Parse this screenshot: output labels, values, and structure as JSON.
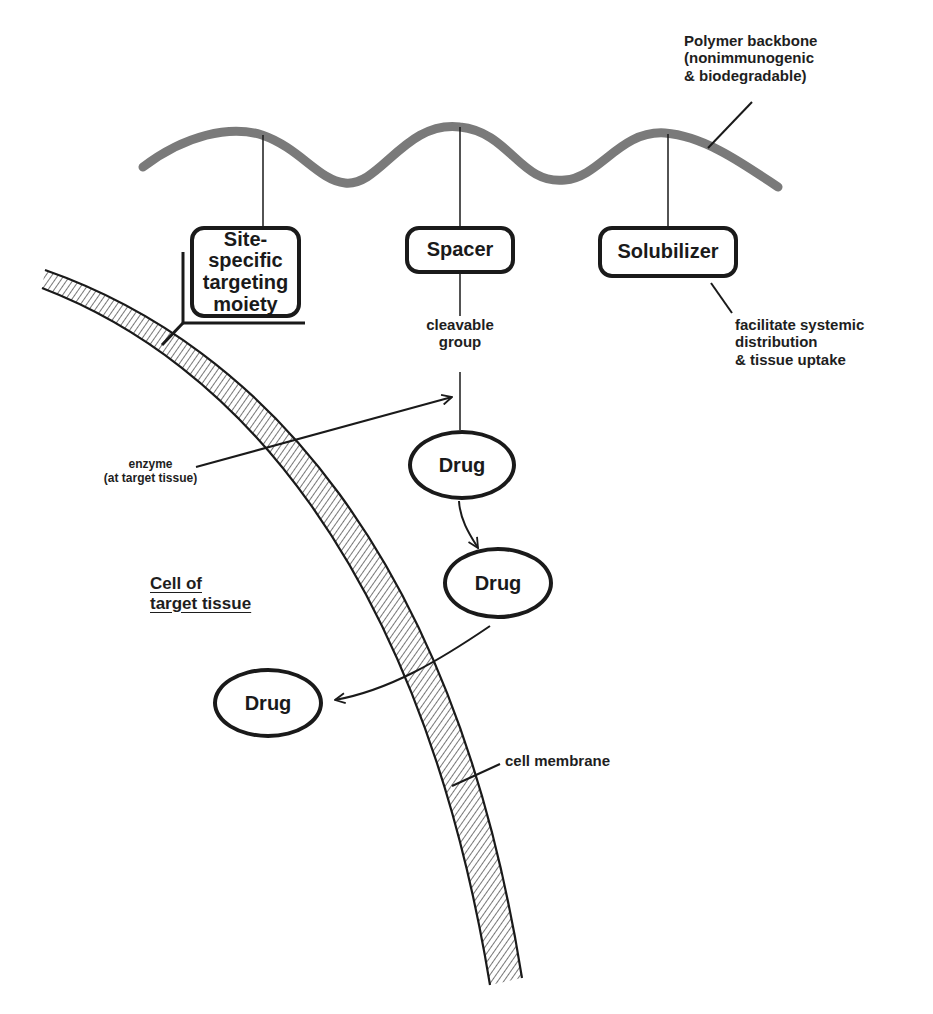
{
  "diagram": {
    "polymer_backbone": {
      "label_lines": [
        "Polymer backbone",
        "(nonimmunogenic",
        "& biodegradable)"
      ]
    },
    "pendant_groups": [
      {
        "id": "targeting",
        "label_lines": [
          "Site-specific",
          "targeting",
          "moiety"
        ]
      },
      {
        "id": "spacer",
        "label": "Spacer"
      },
      {
        "id": "solubilizer",
        "label": "Solubilizer"
      }
    ],
    "annotations": {
      "cleavable_group": [
        "cleavable",
        "group"
      ],
      "solubilizer_note": [
        "facilitate systemic",
        "distribution",
        "& tissue uptake"
      ],
      "enzyme": [
        "enzyme",
        "(at target tissue)"
      ],
      "cell_label": [
        "Cell of",
        "target tissue"
      ],
      "membrane": "cell membrane"
    },
    "drugs": [
      {
        "id": "drug-attached",
        "label": "Drug"
      },
      {
        "id": "drug-released",
        "label": "Drug"
      },
      {
        "id": "drug-internalized",
        "label": "Drug"
      }
    ],
    "colors": {
      "ink": "#1a1a1a",
      "backbone": "#7a7a7a",
      "hatch": "#555555",
      "background": "#ffffff"
    }
  }
}
